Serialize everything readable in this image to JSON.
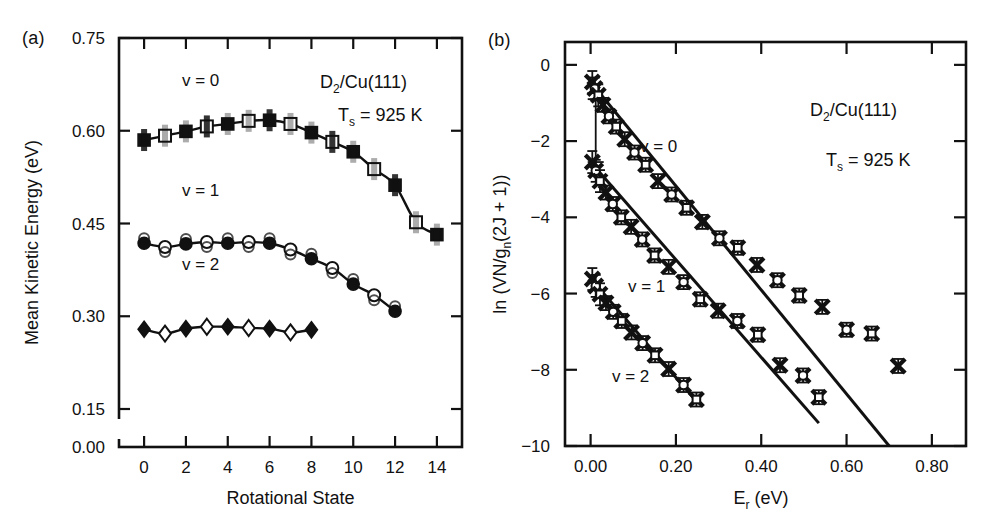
{
  "figure": {
    "panel_a_label": "(a)",
    "panel_b_label": "(b)"
  },
  "panel_a": {
    "name": "mean-kinetic-energy-vs-rotational-state",
    "ylabel": "Mean Kinetic Energy (eV)",
    "xlabel": "Rotational State",
    "ytick_labels": [
      "0.75",
      "0.60",
      "0.45",
      "0.30",
      "0.15",
      "0.00"
    ],
    "xtick_labels": [
      "0",
      "2",
      "4",
      "6",
      "8",
      "10",
      "12",
      "14"
    ],
    "annotations": {
      "system_pre": "D",
      "system_sub": "2",
      "system_post": "/Cu(111)",
      "temp_pre": "T",
      "temp_sub": "s",
      "temp_post": " = 925 K"
    },
    "series_labels": [
      "v = 0",
      "v = 1",
      "v = 2"
    ]
  },
  "panel_b": {
    "name": "boltzmann-plot-ln-population-vs-rotational-energy",
    "ylabel_parts": [
      "ln (VN/g",
      "n",
      "(2J + 1))"
    ],
    "ylabel_flat": "ln (VN/gn(2J + 1))",
    "xlabel_pre": "E",
    "xlabel_sub": "r",
    "xlabel_post": " (eV)",
    "ytick_labels": [
      "0",
      "−2",
      "−4",
      "−6",
      "−8",
      "−10"
    ],
    "xtick_labels": [
      "0.00",
      "0.20",
      "0.40",
      "0.60",
      "0.80"
    ],
    "annotations": {
      "system_pre": "D",
      "system_sub": "2",
      "system_post": "/Cu(111)",
      "temp_pre": "T",
      "temp_sub": "s",
      "temp_post": " = 925 K"
    },
    "series_labels": [
      "v = 0",
      "v = 1",
      "v = 2"
    ]
  },
  "chart_data": [
    {
      "type": "scatter",
      "id": "panel-a",
      "title": "(a) Mean Kinetic Energy vs Rotational State",
      "xlabel": "Rotational State",
      "ylabel": "Mean Kinetic Energy (eV)",
      "xlim": [
        -1.2,
        15.2
      ],
      "ylim": [
        0.0,
        0.75
      ],
      "y_axis_break": {
        "between": [
          0.0,
          0.15
        ],
        "note": "axis broken below 0.15"
      },
      "xticks": [
        0,
        2,
        4,
        6,
        8,
        10,
        12,
        14
      ],
      "yticks": [
        0.0,
        0.15,
        0.3,
        0.45,
        0.6,
        0.75
      ],
      "grid": false,
      "legend": "inline-labels",
      "series": [
        {
          "name": "v = 0",
          "marker": "square",
          "x": [
            0,
            1,
            2,
            3,
            4,
            5,
            6,
            7,
            8,
            9,
            10,
            11,
            12,
            13,
            14
          ],
          "y": [
            0.585,
            0.592,
            0.599,
            0.607,
            0.611,
            0.616,
            0.617,
            0.611,
            0.597,
            0.582,
            0.566,
            0.538,
            0.512,
            0.452,
            0.432
          ],
          "fit_x": [
            0,
            14
          ],
          "fit_note": "smooth curve through points, peak near J=6"
        },
        {
          "name": "v = 1",
          "marker": "circle",
          "x": [
            0,
            1,
            2,
            3,
            4,
            5,
            6,
            7,
            8,
            9,
            10,
            11,
            12
          ],
          "y": [
            0.418,
            0.412,
            0.417,
            0.42,
            0.418,
            0.42,
            0.418,
            0.408,
            0.393,
            0.378,
            0.352,
            0.334,
            0.308
          ],
          "fit_note": "smooth curve, peak near J=4"
        },
        {
          "name": "v = 2",
          "marker": "diamond",
          "x": [
            0,
            1,
            2,
            3,
            4,
            5,
            6,
            7,
            8
          ],
          "y": [
            0.279,
            0.272,
            0.28,
            0.283,
            0.283,
            0.281,
            0.28,
            0.274,
            0.278
          ],
          "fit_note": "nearly flat line"
        }
      ]
    },
    {
      "type": "scatter",
      "id": "panel-b",
      "title": "(b) Boltzmann plot",
      "xlabel": "Er (eV)",
      "ylabel": "ln (VN/gn(2J + 1))",
      "xlim": [
        -0.06,
        0.88
      ],
      "ylim": [
        -10,
        0.6
      ],
      "xticks": [
        0.0,
        0.2,
        0.4,
        0.6,
        0.8
      ],
      "yticks": [
        0,
        -2,
        -4,
        -6,
        -8,
        -10
      ],
      "grid": false,
      "legend": "inline-labels",
      "series": [
        {
          "name": "v = 0",
          "marker": "cross-with-errorbar",
          "x": [
            0.004,
            0.01,
            0.018,
            0.029,
            0.043,
            0.06,
            0.08,
            0.103,
            0.129,
            0.158,
            0.19,
            0.225,
            0.262,
            0.302,
            0.345,
            0.39,
            0.438,
            0.489,
            0.543,
            0.6,
            0.659,
            0.721
          ],
          "y": [
            -0.45,
            -0.62,
            -0.8,
            -1.05,
            -1.35,
            -1.62,
            -1.95,
            -2.3,
            -2.62,
            -3.05,
            -3.4,
            -3.75,
            -4.12,
            -4.55,
            -4.8,
            -5.25,
            -5.65,
            -6.05,
            -6.35,
            -6.95,
            -7.05,
            -7.9
          ],
          "fit": {
            "x": [
              0.0,
              0.7
            ],
            "y": [
              -0.45,
              -10.0
            ]
          }
        },
        {
          "name": "v = 1",
          "marker": "cross-with-errorbar",
          "x": [
            0.004,
            0.012,
            0.022,
            0.036,
            0.052,
            0.072,
            0.095,
            0.121,
            0.15,
            0.183,
            0.218,
            0.257,
            0.299,
            0.344,
            0.392,
            0.444,
            0.498,
            0.535
          ],
          "y": [
            -2.55,
            -2.78,
            -3.05,
            -3.35,
            -3.65,
            -4.0,
            -4.25,
            -4.58,
            -5.0,
            -5.3,
            -5.7,
            -6.15,
            -6.45,
            -6.72,
            -7.08,
            -7.88,
            -8.15,
            -8.72
          ],
          "fit": {
            "x": [
              0.0,
              0.535
            ],
            "y": [
              -2.55,
              -9.4
            ]
          }
        },
        {
          "name": "v = 2",
          "marker": "cross-with-errorbar",
          "x": [
            0.004,
            0.012,
            0.022,
            0.036,
            0.053,
            0.073,
            0.096,
            0.122,
            0.151,
            0.183,
            0.218,
            0.248
          ],
          "y": [
            -5.62,
            -5.8,
            -6.02,
            -6.25,
            -6.48,
            -6.72,
            -7.02,
            -7.3,
            -7.62,
            -7.98,
            -8.4,
            -8.78
          ],
          "fit": {
            "x": [
              0.0,
              0.25
            ],
            "y": [
              -5.6,
              -8.85
            ]
          }
        }
      ]
    }
  ]
}
